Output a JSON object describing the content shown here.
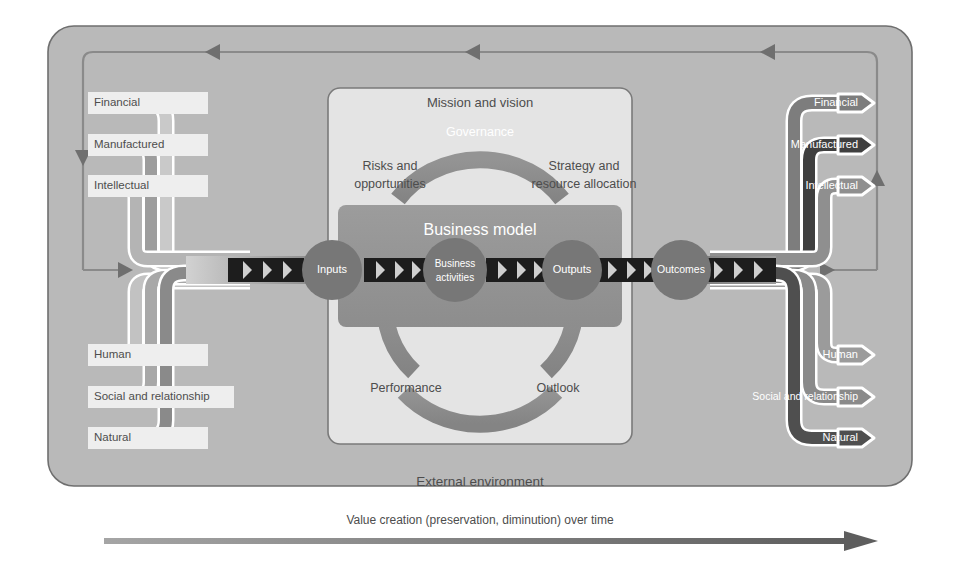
{
  "diagram": {
    "title_caption": "Value creation (preservation, diminution) over time",
    "external_environment_label": "External environment",
    "business_model_label": "Business model",
    "colors": {
      "page_background": "#ffffff",
      "external_environment_fill": "#b9b9b9",
      "organization_fill": "#e2e2e2",
      "band_light": "#c8c8c8",
      "band_mid": "#9a9a9a",
      "band_dark": "#6e6e6e",
      "band_darkest": "#4a4a4a",
      "ring_fill": "#8d8d8d",
      "node_fill": "#777777",
      "chevron_dark": "#1d1d1d",
      "outline_white": "#ffffff",
      "stroke_gray": "#6b6b6b",
      "loop_line": "#8a8a8a",
      "text_dark": "#4d4d4d",
      "text_light": "#ffffff",
      "timeline_arrow": "#8e8e8e"
    }
  },
  "capitals_in": {
    "group_label": "Capitals (inputs)",
    "items": [
      {
        "label": "Financial",
        "tone": "#c9c9c9"
      },
      {
        "label": "Manufactured",
        "tone": "#9d9d9d"
      },
      {
        "label": "Intellectual",
        "tone": "#b4b4b4"
      },
      {
        "label": "Human",
        "tone": "#c2c2c2"
      },
      {
        "label": "Social and relationship",
        "tone": "#a8a8a8"
      },
      {
        "label": "Natural",
        "tone": "#8a8a8a"
      }
    ]
  },
  "capitals_out": {
    "group_label": "Capitals (outcomes)",
    "items": [
      {
        "label": "Financial",
        "tone": "#7d7d7d"
      },
      {
        "label": "Manufactured",
        "tone": "#3f3f3f"
      },
      {
        "label": "Intellectual",
        "tone": "#8f8f8f"
      },
      {
        "label": "Human",
        "tone": "#9b9b9b"
      },
      {
        "label": "Social and relationship",
        "tone": "#8a8a8a"
      },
      {
        "label": "Natural",
        "tone": "#4f4f4f"
      }
    ]
  },
  "process_nodes": [
    {
      "label": "Inputs",
      "lines": [
        "Inputs"
      ]
    },
    {
      "label": "Business activities",
      "lines": [
        "Business",
        "activities"
      ]
    },
    {
      "label": "Outputs",
      "lines": [
        "Outputs"
      ]
    },
    {
      "label": "Outcomes",
      "lines": [
        "Outcomes"
      ]
    }
  ],
  "ring_labels": {
    "mission_and_vision": "Mission and vision",
    "governance": "Governance",
    "risks_and_opportunities": [
      "Risks and",
      "opportunities"
    ],
    "strategy_and_resource_allocation": [
      "Strategy and",
      "resource allocation"
    ],
    "performance": "Performance",
    "outlook": "Outlook"
  },
  "timeline": {
    "caption": "Value creation (preservation, diminution) over time"
  }
}
